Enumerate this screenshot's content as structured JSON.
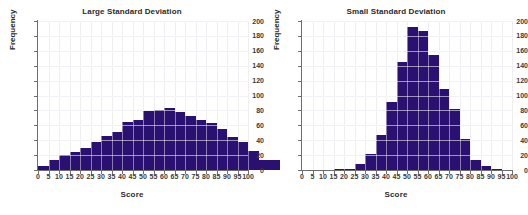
{
  "figure": {
    "background": "#ffffff",
    "bar_color": "#2a1070",
    "grid_color": "#e2e2ea",
    "axis_color": "#6e6e6e",
    "text_color": "#2b2b2b"
  },
  "chart_data": [
    {
      "type": "bar",
      "title": "Large Standard Deviation",
      "xlabel": "Score",
      "ylabel": "Frequency",
      "xlim": [
        0,
        100
      ],
      "ylim": [
        0,
        200
      ],
      "ytick_step": 20,
      "xtick_step": 5,
      "grid": true,
      "legend": "none",
      "bin_width": 5,
      "categories": [
        0,
        5,
        10,
        15,
        20,
        25,
        30,
        35,
        40,
        45,
        50,
        55,
        60,
        65,
        70,
        75,
        80,
        85,
        90,
        95,
        100
      ],
      "xtick_labels": [
        "0",
        "5",
        "10",
        "15",
        "20",
        "25",
        "30",
        "35",
        "40",
        "45",
        "50",
        "55",
        "60",
        "65",
        "70",
        "75",
        "80",
        "85",
        "90",
        "95",
        "100"
      ],
      "ytick_labels": [
        "0",
        "20",
        "40",
        "60",
        "80",
        "100",
        "120",
        "140",
        "160",
        "180",
        "200"
      ],
      "values": [
        5,
        13,
        20,
        24,
        30,
        38,
        45,
        51,
        64,
        67,
        79,
        80,
        83,
        78,
        73,
        67,
        63,
        55,
        44,
        37,
        25,
        14,
        13
      ]
    },
    {
      "type": "bar",
      "title": "Small Standard Deviation",
      "xlabel": "Score",
      "ylabel": "Frequency",
      "xlim": [
        0,
        100
      ],
      "ylim": [
        0,
        200
      ],
      "ytick_step": 20,
      "xtick_step": 5,
      "grid": true,
      "legend": "none",
      "bin_width": 5,
      "categories": [
        0,
        5,
        10,
        15,
        20,
        25,
        30,
        35,
        40,
        45,
        50,
        55,
        60,
        65,
        70,
        75,
        80,
        85,
        90,
        95,
        100
      ],
      "xtick_labels": [
        "0",
        "5",
        "10",
        "15",
        "20",
        "25",
        "30",
        "35",
        "40",
        "45",
        "50",
        "55",
        "60",
        "65",
        "70",
        "75",
        "80",
        "85",
        "90",
        "95",
        "100"
      ],
      "ytick_labels": [
        "0",
        "20",
        "40",
        "60",
        "80",
        "100",
        "120",
        "140",
        "160",
        "180",
        "200"
      ],
      "values": [
        0,
        0,
        0,
        1,
        2,
        8,
        22,
        47,
        91,
        145,
        192,
        186,
        155,
        109,
        82,
        42,
        13,
        6,
        2,
        0,
        0
      ]
    }
  ]
}
